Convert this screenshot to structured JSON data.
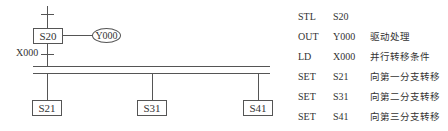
{
  "diagram": {
    "initial_step": "S20",
    "output_coil": "Y000",
    "transition_condition": "X000",
    "branch_steps": [
      "S21",
      "S31",
      "S41"
    ]
  },
  "program": [
    {
      "instr": "STL",
      "operand": "S20",
      "comment": ""
    },
    {
      "instr": "OUT",
      "operand": "Y000",
      "comment": "驱动处理"
    },
    {
      "instr": "LD",
      "operand": "X000",
      "comment": "并行转移条件"
    },
    {
      "instr": "SET",
      "operand": "S21",
      "comment": "向第一分支转移"
    },
    {
      "instr": "SET",
      "operand": "S31",
      "comment": "向第二分支转移"
    },
    {
      "instr": "SET",
      "operand": "S41",
      "comment": "向第三分支转移"
    }
  ]
}
